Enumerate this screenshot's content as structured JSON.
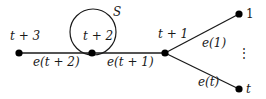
{
  "diagram": {
    "nodes": [
      {
        "id": "n3",
        "label": "t + 3",
        "x": 19,
        "y": 53
      },
      {
        "id": "n2",
        "label": "t + 2",
        "x": 92,
        "y": 53
      },
      {
        "id": "n1",
        "label": "t + 1",
        "x": 165,
        "y": 53
      },
      {
        "id": "leaf1",
        "label": "1",
        "x": 239,
        "y": 14
      },
      {
        "id": "leaft",
        "label": "t",
        "x": 239,
        "y": 89
      }
    ],
    "edges": [
      {
        "from": "n3",
        "to": "n2",
        "label": "e(t + 2)"
      },
      {
        "from": "n2",
        "to": "n1",
        "label": "e(t + 1)"
      },
      {
        "from": "n1",
        "to": "leaf1",
        "label": "e(1)"
      },
      {
        "from": "n1",
        "to": "leaft",
        "label": "e(t)"
      }
    ],
    "set": {
      "label": "S",
      "cx": 93,
      "cy": 32,
      "r": 23
    },
    "ellipsis": "⋮",
    "colors": {
      "line": "#1a1a1a",
      "node": "#000000",
      "background": "#ffffff"
    }
  }
}
